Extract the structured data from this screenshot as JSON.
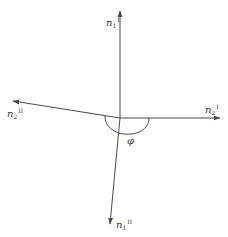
{
  "diagram": {
    "title": "",
    "colors": {
      "stroke": "#4a4a4a",
      "text": "#333333",
      "background": "#ffffff"
    },
    "origin": {
      "x": 120,
      "y": 118
    },
    "vectors": [
      {
        "id": "n1_I",
        "symbol": "n",
        "subscript": "1",
        "superscript": "I",
        "direction": "up",
        "end": {
          "x": 120,
          "y": 10
        }
      },
      {
        "id": "n2_I",
        "symbol": "n",
        "subscript": "2",
        "superscript": "I",
        "direction": "right",
        "end": {
          "x": 221,
          "y": 118
        }
      },
      {
        "id": "n2_II",
        "symbol": "n",
        "subscript": "2",
        "superscript": "II",
        "direction": "left-up",
        "end": {
          "x": 12,
          "y": 101
        }
      },
      {
        "id": "n1_II",
        "symbol": "n",
        "subscript": "1",
        "superscript": "II",
        "direction": "down-left",
        "end": {
          "x": 110,
          "y": 225
        }
      }
    ],
    "angle": {
      "symbol": "φ",
      "description": "angle between n2_II and n2_I measured through the lower half"
    },
    "labels": {
      "n1_I": {
        "base": "n",
        "sub": "1",
        "sup": "I"
      },
      "n2_I": {
        "base": "n",
        "sub": "2",
        "sup": "I"
      },
      "n2_II": {
        "base": "n",
        "sub": "2",
        "sup": "II"
      },
      "n1_II": {
        "base": "n",
        "sub": "1",
        "sup": "II"
      },
      "phi": "φ"
    }
  }
}
